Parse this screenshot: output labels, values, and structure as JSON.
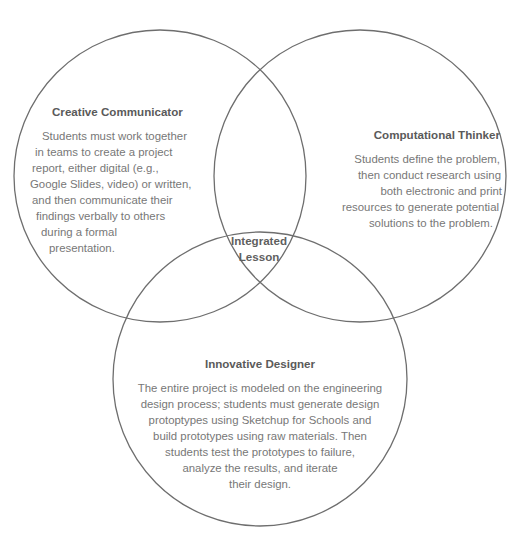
{
  "diagram": {
    "type": "venn",
    "stroke_color": "#6e6e6e",
    "circles": [
      {
        "id": "creative-communicator",
        "title": "Creative Communicator",
        "lines": [
          "Students must work together",
          "in teams to create a project",
          "report, either digital (e.g.,",
          "Google Slides, video) or written,",
          "and then communicate their",
          "findings verbally to others",
          "during a formal",
          "presentation."
        ]
      },
      {
        "id": "computational-thinker",
        "title": "Computational Thinker",
        "lines": [
          "Students define the problem,",
          "then conduct research using",
          "both electronic and print",
          "resources to generate potential",
          "solutions to the problem."
        ]
      },
      {
        "id": "innovative-designer",
        "title": "Innovative Designer",
        "lines": [
          "The entire project is modeled on the engineering",
          "design process; students must generate design",
          "protoptypes using Sketchup for Schools and",
          "build prototypes using raw materials. Then",
          "students test the prototypes to failure,",
          "analyze the results, and iterate",
          "their design."
        ]
      }
    ],
    "center": {
      "line1": "Integrated",
      "line2": "Lesson"
    }
  }
}
